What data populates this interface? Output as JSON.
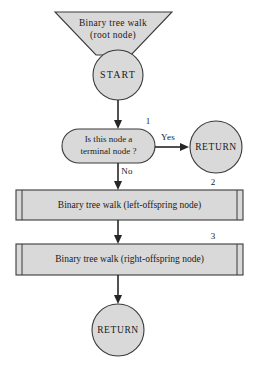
{
  "diagram": {
    "colors": {
      "shape_fill": "#d9d9d9",
      "shape_stroke": "#3a3a3a",
      "line": "#262626",
      "background": "#ffffff"
    },
    "header": {
      "line1": "Binary tree walk",
      "line2": "(root node)"
    },
    "start_node": {
      "label": "START"
    },
    "decision": {
      "line1": "Is this node a",
      "line2": "terminal node ?",
      "step_number": "1",
      "yes_label": "Yes",
      "no_label": "No"
    },
    "return_right": {
      "label": "RETURN"
    },
    "process_left": {
      "label": "Binary tree walk (left-offspring node)",
      "step_number": "2"
    },
    "process_right": {
      "label": "Binary tree walk (right-offspring node)",
      "step_number": "3"
    },
    "return_bottom": {
      "label": "RETURN"
    }
  }
}
